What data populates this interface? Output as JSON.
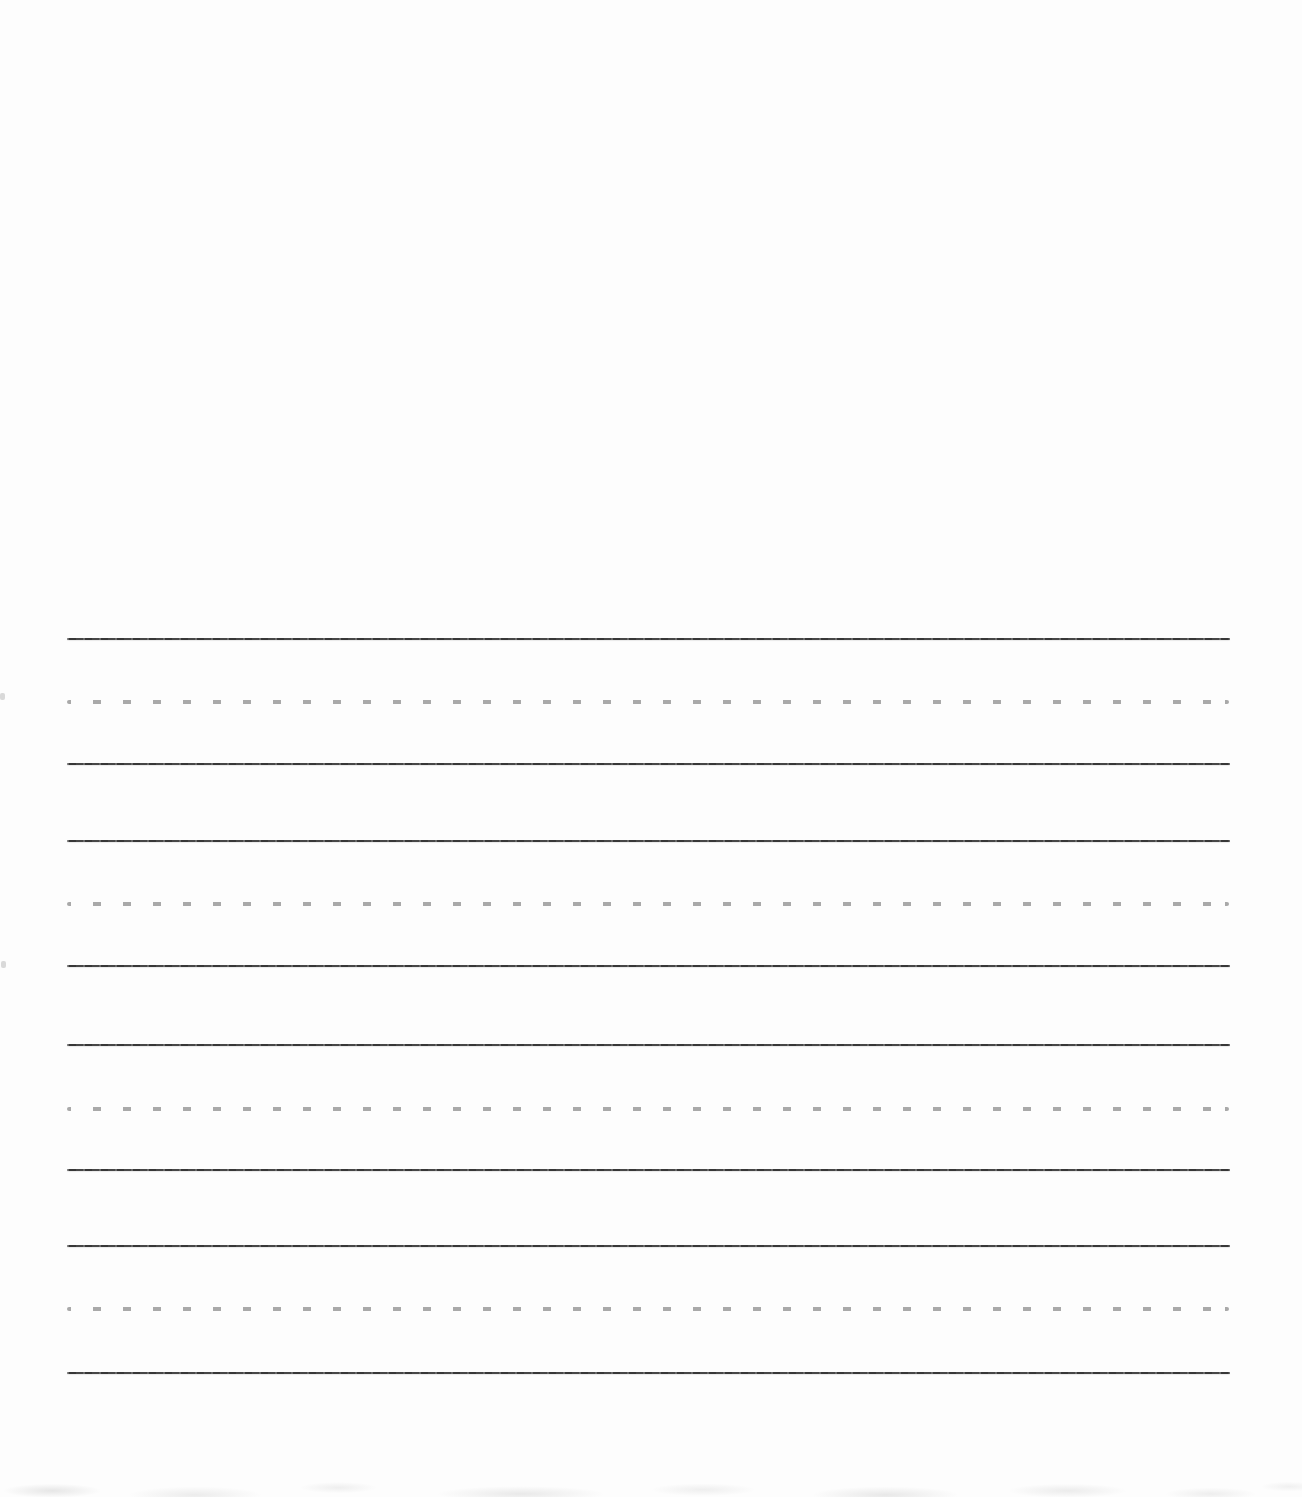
{
  "page": {
    "background_color": "#fdfdfd",
    "kind": "blank handwriting practice worksheet"
  },
  "worksheet": {
    "row_count": 4,
    "line_left_x": 67,
    "line_right_x": 1230,
    "solid_line_color": "#3d3d3d",
    "solid_line_thickness_px": 2,
    "midline_dash_color": "#a9a9a9",
    "midline_dash_width_px": 8,
    "midline_dash_gap_px": 22,
    "midline_dash_height_px": 4,
    "rows": [
      {
        "top_line_y": 639,
        "midline_y": 702,
        "baseline_y": 764
      },
      {
        "top_line_y": 841,
        "midline_y": 904,
        "baseline_y": 966
      },
      {
        "top_line_y": 1045,
        "midline_y": 1109,
        "baseline_y": 1170
      },
      {
        "top_line_y": 1246,
        "midline_y": 1309,
        "baseline_y": 1373
      }
    ]
  },
  "scan_artifacts": {
    "left_edge_specks": [
      {
        "x": 0,
        "y": 693
      },
      {
        "x": 1,
        "y": 961
      }
    ]
  }
}
